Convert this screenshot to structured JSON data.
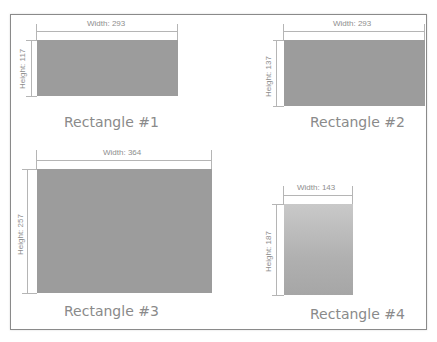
{
  "diagram": {
    "rectangles": [
      {
        "title": "Rectangle #1",
        "width_label": "Width: 293",
        "height_label": "Height: 117",
        "width": 293,
        "height": 117,
        "fill": "#9c9c9c"
      },
      {
        "title": "Rectangle #2",
        "width_label": "Width: 293",
        "height_label": "Height: 137",
        "width": 293,
        "height": 137,
        "fill": "#9c9c9c"
      },
      {
        "title": "Rectangle #3",
        "width_label": "Width: 364",
        "height_label": "Height: 257",
        "width": 364,
        "height": 257,
        "fill": "#9c9c9c"
      },
      {
        "title": "Rectangle #4",
        "width_label": "Width: 143",
        "height_label": "Height: 187",
        "width": 143,
        "height": 187,
        "fill": "gradient #c9c9c9 to #a6a6a6"
      }
    ]
  }
}
